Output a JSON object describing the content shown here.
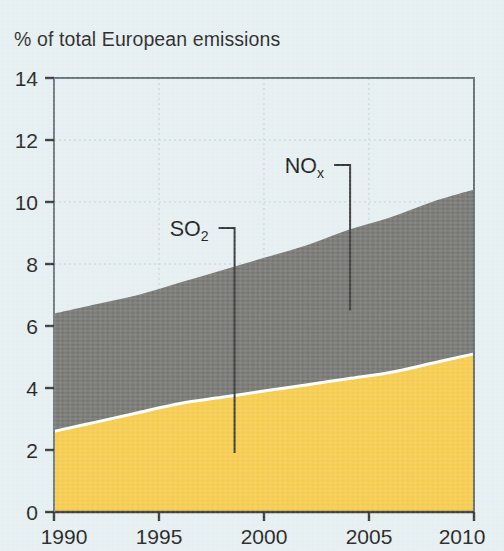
{
  "chart_data": {
    "type": "area",
    "title": "% of total European emissions",
    "subtitle": "",
    "xlabel": "",
    "ylabel": "% of total European emissions",
    "stacked": true,
    "xlim": [
      1990,
      2010
    ],
    "ylim": [
      0,
      14
    ],
    "x_ticks": [
      "1990",
      "1995",
      "2000",
      "2005",
      "2010"
    ],
    "x_tick_values": [
      1990,
      1995,
      2000,
      2005,
      2010
    ],
    "y_ticks": [
      "0",
      "2",
      "4",
      "6",
      "8",
      "10",
      "12",
      "14"
    ],
    "y_tick_values": [
      0,
      2,
      4,
      6,
      8,
      10,
      12,
      14
    ],
    "grid": true,
    "grid_style": "dotted",
    "legend": "inline-annotations",
    "x": [
      1990,
      1992,
      1994,
      1996,
      1998,
      2000,
      2002,
      2004,
      2006,
      2008,
      2010
    ],
    "series": [
      {
        "name": "SO2",
        "label_text": "SO",
        "label_subscript": "2",
        "color": "#f5c843",
        "values": [
          2.6,
          2.9,
          3.2,
          3.5,
          3.7,
          3.9,
          4.1,
          4.3,
          4.5,
          4.8,
          5.1
        ]
      },
      {
        "name": "NOx",
        "label_text": "NO",
        "label_subscript": "x",
        "color": "#6e6e6b",
        "values": [
          3.8,
          3.8,
          3.8,
          3.9,
          4.1,
          4.3,
          4.5,
          4.8,
          5.0,
          5.2,
          5.3
        ]
      }
    ],
    "cumulative_top": [
      6.4,
      6.7,
      7.0,
      7.4,
      7.8,
      8.2,
      8.6,
      9.1,
      9.5,
      10.0,
      10.4
    ],
    "annotations": [
      {
        "name": "SO2",
        "text": "SO",
        "subscript": "2",
        "points_to_year": 1998.6,
        "points_to_value": 1.9
      },
      {
        "name": "NOx",
        "text": "NO",
        "subscript": "x",
        "points_to_year": 2004.1,
        "points_to_value": 6.5
      }
    ],
    "colors": {
      "background": "#e4eef0",
      "axis": "#4a4a4a",
      "grid": "#b9cdd2",
      "text": "#141414",
      "separator": "#ffffff",
      "so2": "#f5c843",
      "nox": "#6e6e6b"
    }
  }
}
